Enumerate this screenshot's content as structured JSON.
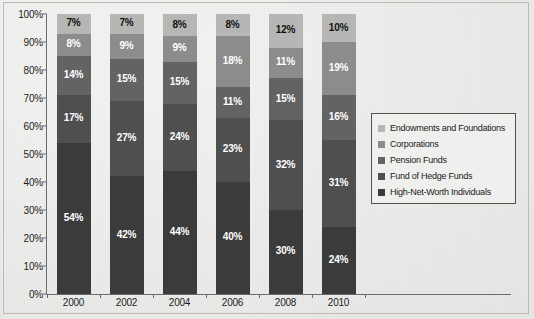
{
  "chart_data": {
    "type": "bar",
    "stacked": true,
    "normalized": "100%",
    "title": "",
    "xlabel": "",
    "ylabel": "",
    "categories": [
      "2000",
      "2002",
      "2004",
      "2006",
      "2008",
      "2010"
    ],
    "ylim": [
      0,
      100
    ],
    "yticks": [
      "0%",
      "10%",
      "20%",
      "30%",
      "40%",
      "50%",
      "60%",
      "70%",
      "80%",
      "90%",
      "100%"
    ],
    "ytick_values": [
      0,
      10,
      20,
      30,
      40,
      50,
      60,
      70,
      80,
      90,
      100
    ],
    "grid": false,
    "legend_position": "right",
    "value_suffix": "%",
    "series": [
      {
        "name": "High-Net-Worth Individuals",
        "color": "#3b3b3b",
        "label_color": "#ffffff",
        "values": [
          54,
          42,
          44,
          40,
          30,
          24
        ],
        "labels": [
          "54%",
          "42%",
          "44%",
          "40%",
          "30%",
          "24%"
        ]
      },
      {
        "name": "Fund of Hedge Funds",
        "color": "#4f4f4f",
        "label_color": "#ffffff",
        "values": [
          17,
          27,
          24,
          23,
          32,
          31
        ],
        "labels": [
          "17%",
          "27%",
          "24%",
          "23%",
          "32%",
          "31%"
        ]
      },
      {
        "name": "Pension Funds",
        "color": "#636363",
        "label_color": "#ffffff",
        "values": [
          14,
          15,
          15,
          11,
          15,
          16
        ],
        "labels": [
          "14%",
          "15%",
          "15%",
          "11%",
          "15%",
          "16%"
        ]
      },
      {
        "name": "Corporations",
        "color": "#8c8c8c",
        "label_color": "#ffffff",
        "values": [
          8,
          9,
          9,
          18,
          11,
          19
        ],
        "labels": [
          "8%",
          "9%",
          "9%",
          "18%",
          "11%",
          "19%"
        ]
      },
      {
        "name": "Endowments and Foundations",
        "color": "#b6b6b4",
        "label_color": "#111111",
        "values": [
          7,
          7,
          8,
          8,
          12,
          10
        ],
        "labels": [
          "7%",
          "7%",
          "8%",
          "8%",
          "12%",
          "10%"
        ]
      }
    ]
  }
}
